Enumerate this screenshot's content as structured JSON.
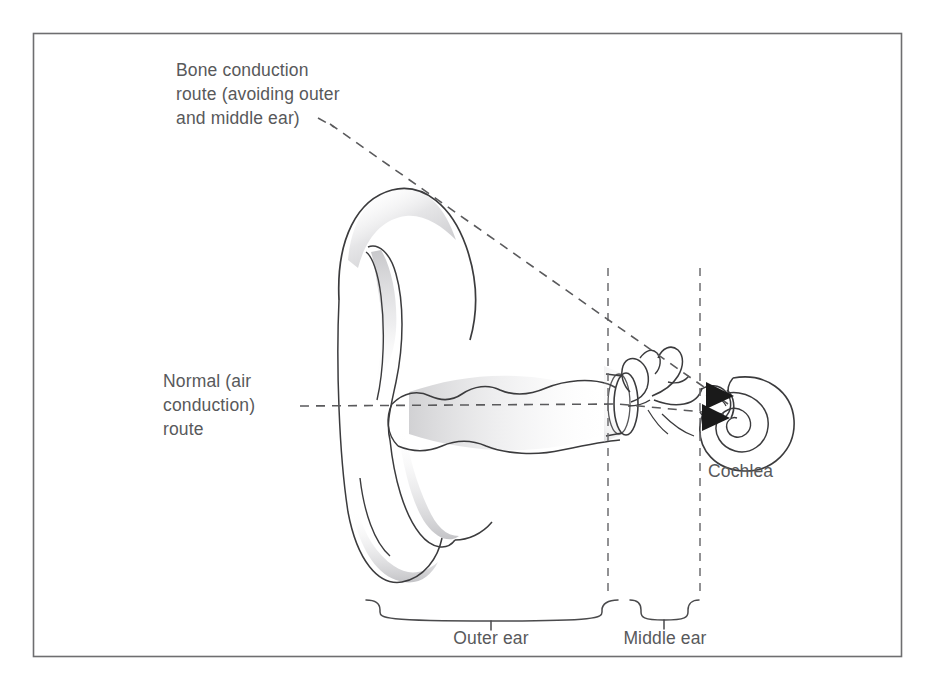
{
  "figure": {
    "background_color": "#ffffff",
    "border_color": "#6e6e70",
    "ink_color": "#3b3b3d",
    "text_color": "#58595b",
    "shading_color": "#b9b9bc",
    "arrow_color": "#1a1a1a"
  },
  "labels": {
    "bone_route": {
      "line1": "Bone conduction",
      "line2": "route (avoiding outer",
      "line3": "and middle ear)"
    },
    "air_route": {
      "line1": "Normal (air",
      "line2": "conduction)",
      "line3": "route"
    },
    "cochlea": "Cochlea",
    "outer_ear": "Outer ear",
    "middle_ear": "Middle ear"
  },
  "regions": [
    {
      "name": "outer-ear",
      "label": "Outer ear",
      "brace_start_x": 365,
      "brace_end_x": 622
    },
    {
      "name": "middle-ear",
      "label": "Middle ear",
      "brace_start_x": 629,
      "brace_end_x": 700
    }
  ],
  "routes": [
    {
      "name": "bone-conduction",
      "style": "dashed",
      "from_label": "Bone conduction route (avoiding outer and middle ear)",
      "to": "Cochlea"
    },
    {
      "name": "air-conduction",
      "style": "dashed",
      "from_label": "Normal (air conduction) route",
      "to": "Cochlea"
    }
  ],
  "structures": [
    "pinna",
    "ear-canal",
    "eardrum",
    "ossicles",
    "cochlea"
  ]
}
